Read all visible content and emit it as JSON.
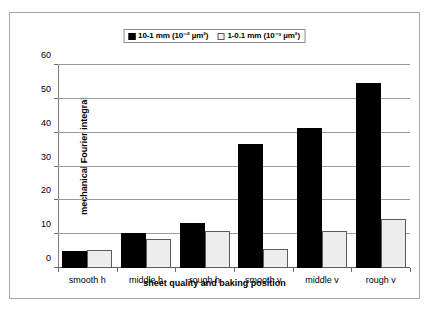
{
  "chart_data": {
    "type": "bar",
    "title": "",
    "xlabel": "sheet quality and baking position",
    "ylabel": "mechanical Fourier integral",
    "categories": [
      "smooth  h",
      "middle  h",
      "rough  h",
      "smooth  v",
      "middle  v",
      "rough  v"
    ],
    "series": [
      {
        "name": "10-1 mm (10⁻² µm²)",
        "values": [
          5.0,
          10.3,
          13.2,
          36.8,
          41.4,
          54.8
        ],
        "color": "#000000"
      },
      {
        "name": "1-0.1 mm (10⁻³ µm²)",
        "values": [
          5.3,
          8.7,
          10.8,
          5.5,
          11.0,
          14.5
        ],
        "color": "#ededed"
      }
    ],
    "ylim": [
      0,
      60
    ],
    "yticks": [
      0,
      10,
      20,
      30,
      40,
      50,
      60
    ],
    "ytick_labels": [
      "0",
      "10",
      "20",
      "30",
      "40",
      "50",
      "60"
    ],
    "grid": true,
    "legend_position": "top-center"
  },
  "legend": {
    "entries": [
      {
        "label": "10-1 mm (10⁻² µm²)",
        "swatch": "filled-square-icon"
      },
      {
        "label": "1-0.1 mm (10⁻³ µm²)",
        "swatch": "hollow-square-icon"
      }
    ]
  }
}
